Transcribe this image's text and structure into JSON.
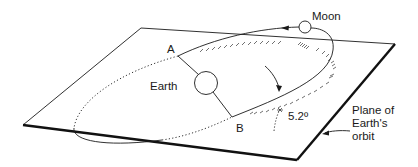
{
  "diagram": {
    "labels": {
      "moon": "Moon",
      "earth": "Earth",
      "point_a": "A",
      "point_b": "B",
      "angle": "5.2º",
      "plane_line1": "Plane of",
      "plane_line2": "Earth's",
      "plane_line3": "orbit"
    },
    "colors": {
      "stroke": "#1a1a1a",
      "background": "#ffffff"
    }
  }
}
